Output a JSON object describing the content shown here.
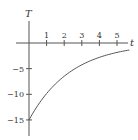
{
  "chart_data": {
    "type": "line",
    "title": "",
    "xlabel": "t",
    "ylabel": "T",
    "x_ticks": [
      "1",
      "2",
      "3",
      "4",
      "5"
    ],
    "y_ticks": [
      "-5",
      "-10",
      "-15"
    ],
    "xlim": [
      0,
      5.7
    ],
    "ylim": [
      -17.5,
      4
    ],
    "grid": false,
    "legend": null,
    "series": [
      {
        "name": "T(t) = -15 e^{-0.42 t}",
        "x": [
          0,
          0.5,
          1,
          1.5,
          2,
          2.5,
          3,
          3.5,
          4,
          4.5,
          5,
          5.5
        ],
        "y": [
          -15,
          -12.2,
          -9.9,
          -8.0,
          -6.5,
          -5.2,
          -4.3,
          -3.4,
          -2.8,
          -2.3,
          -1.8,
          -1.5
        ]
      }
    ]
  }
}
